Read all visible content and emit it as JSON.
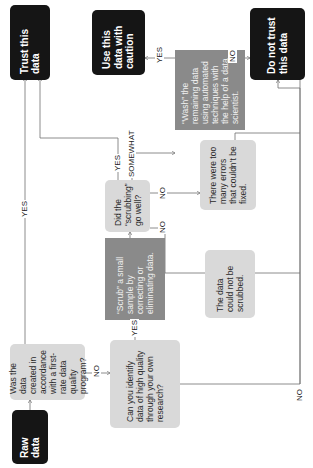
{
  "nodes": {
    "raw_data": "Raw data",
    "q_quality_program": "Was the data created in accordance with a first-rate data quality program?",
    "q_own_research": "Can you identify data of high quality through your own research?",
    "scrub": "“Scrub” a small sample by correcting or eliminating data.",
    "q_scrubbing": "Did the “scrubbing” go well?",
    "too_many_errors": "There were too many errors that couldn’t be fixed.",
    "could_not_scrub": "The data could not be scrubbed.",
    "wash": "“Wash” the remaining data using automated techniques with the help of a data scientist.",
    "q_washing": "Did the “washing” go well?",
    "use_with_caution": "Use this data with caution",
    "trust": "Trust this data",
    "do_not_trust": "Do not trust this data"
  },
  "edge_labels": {
    "q1_yes": "YES",
    "q1_no": "NO",
    "q2_yes": "YES",
    "q2_no": "NO",
    "scrub_yes": "YES",
    "scrub_somewhat": "SOMEWHAT",
    "scrub_no_1": "NO",
    "scrub_no_2": "NO",
    "wash_yes": "YES",
    "wash_no": "NO"
  },
  "colors": {
    "terminal": "#151515",
    "question": "#d9d9d9",
    "action": "#8a8a8a",
    "connector": "#707070"
  }
}
